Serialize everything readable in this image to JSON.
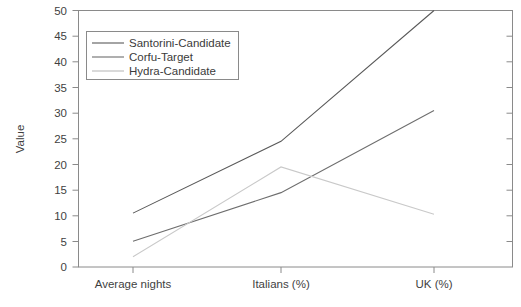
{
  "chart_data": {
    "type": "line",
    "title": "",
    "xlabel": "",
    "ylabel": "Value",
    "categories": [
      "Average nights",
      "Italians (%)",
      "UK (%)"
    ],
    "series": [
      {
        "name": "Santorini-Candidate",
        "values": [
          10.5,
          24.5,
          50
        ],
        "color": "#595959"
      },
      {
        "name": "Corfu-Target",
        "values": [
          5,
          14.5,
          30.5
        ],
        "color": "#6e6e6e"
      },
      {
        "name": "Hydra-Candidate",
        "values": [
          2,
          19.5,
          10.3
        ],
        "color": "#c9c9c9"
      }
    ],
    "ylim": [
      0,
      50
    ],
    "ytick_values": [
      0,
      5,
      10,
      15,
      20,
      25,
      30,
      35,
      40,
      45,
      50
    ],
    "ytick_labels": [
      "0",
      "5",
      "10",
      "15",
      "20",
      "25",
      "30",
      "35",
      "40",
      "45",
      "50"
    ],
    "grid": false,
    "legend_position": "upper-left-inside"
  },
  "axes": {
    "y_title": "Value",
    "y_labels": [
      "50",
      "45",
      "40",
      "35",
      "30",
      "25",
      "20",
      "15",
      "10",
      "5",
      "0"
    ],
    "x_labels": [
      "Average nights",
      "Italians (%)",
      "UK (%)"
    ]
  },
  "legend": {
    "entries": [
      {
        "label": "Santorini-Candidate"
      },
      {
        "label": "Corfu-Target"
      },
      {
        "label": "Hydra-Candidate"
      }
    ]
  },
  "colors": {
    "series_1": "#595959",
    "series_2": "#6e6e6e",
    "series_3": "#c9c9c9",
    "axis": "#808080",
    "text": "#3f3f3f",
    "legend_border": "#8a8a8a",
    "background": "#ffffff"
  }
}
